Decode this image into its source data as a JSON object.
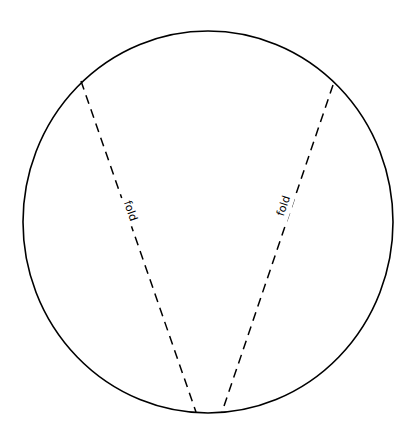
{
  "diagram": {
    "colors": {
      "stroke": "#000000",
      "background": "#ffffff"
    },
    "folds": [
      {
        "label": "fold",
        "style": "dashed"
      },
      {
        "label": "fold",
        "style": "dashed"
      }
    ]
  }
}
